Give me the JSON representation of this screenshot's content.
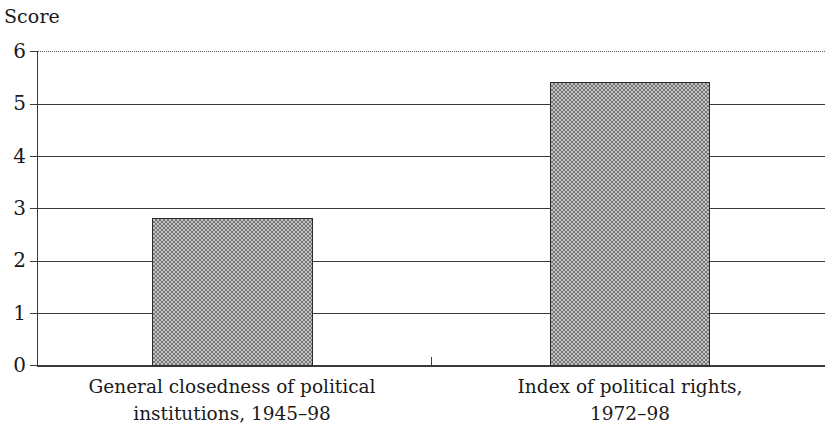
{
  "chart_data": {
    "type": "bar",
    "title": "",
    "subtitle": "",
    "xlabel": "",
    "ylabel": "Score",
    "ylim": [
      0,
      6
    ],
    "ytick_labels": [
      "0",
      "1",
      "2",
      "3",
      "4",
      "5",
      "6"
    ],
    "ytick_values": [
      0,
      1,
      2,
      3,
      4,
      5,
      6
    ],
    "grid": "horizontal",
    "legend": "none",
    "categories": [
      "General closedness of political institutions, 1945–98",
      "Index of political rights, 1972–98"
    ],
    "category_lines": [
      [
        "General closedness of political",
        "institutions, 1945–98"
      ],
      [
        "Index of political rights,",
        "1972–98"
      ]
    ],
    "values": [
      2.83,
      5.43
    ],
    "bar_fill": "#9a9a9a",
    "bar_fill_pattern": "checkerboard-dither",
    "bar_border_color": "#2b2b2b",
    "axis_color": "#3a3a3a",
    "gridline_styles": [
      "solid",
      "solid",
      "solid",
      "solid",
      "solid",
      "solid",
      "dotted"
    ],
    "annotations": []
  },
  "axis": {
    "y_title": "Score"
  }
}
